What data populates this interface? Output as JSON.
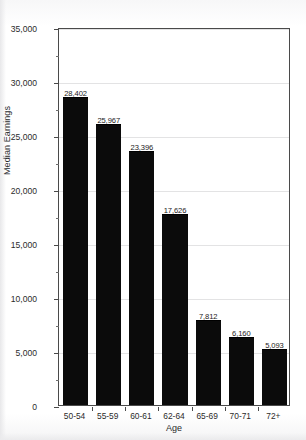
{
  "chart_data": {
    "type": "bar",
    "title": "",
    "xlabel": "Age",
    "ylabel": "Median Earnings",
    "categories": [
      "50-54",
      "55-59",
      "60-61",
      "62-64",
      "65-69",
      "70-71",
      "72+"
    ],
    "values": [
      28402,
      25967,
      23396,
      17626,
      7812,
      6160,
      5093
    ],
    "value_labels": [
      "28,402",
      "25,967",
      "23,396",
      "17,626",
      "7,812",
      "6,160",
      "5,093"
    ],
    "ylim": [
      0,
      35000
    ],
    "ytick_labels": [
      "0",
      "5,000",
      "10,000",
      "15,000",
      "20,000",
      "25,000",
      "30,000",
      "35,000"
    ],
    "ytick_values": [
      0,
      5000,
      10000,
      15000,
      20000,
      25000,
      30000,
      35000
    ],
    "yminor_step": 2500,
    "grid": "horizontal",
    "legend": "none",
    "bar_color": "#0b0b0b"
  },
  "axes": {
    "y_title": "Median Earnings",
    "x_title": "Age"
  }
}
